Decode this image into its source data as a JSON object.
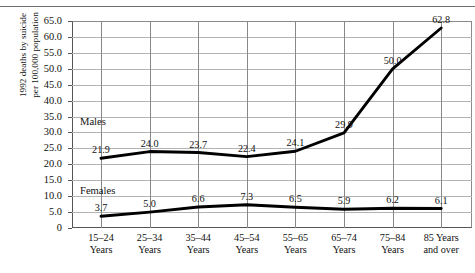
{
  "figure": {
    "has_top_rule": true,
    "background": "#ffffff",
    "line_color": "#000000",
    "gridline_color": "#b3b3b3",
    "vertical_gridline_color": "#888888",
    "axis_color": "#555555"
  },
  "chart_data": {
    "type": "line",
    "title": "",
    "subtitle": "",
    "xlabel": "",
    "ylabel_lines": [
      "1992 deaths by suicide",
      "per 100,000 population"
    ],
    "ylabel": "1992 deaths by suicide per 100,000 population",
    "categories": [
      "15–24 Years",
      "25–34 Years",
      "35–44 Years",
      "45–54 Years",
      "55–65 Years",
      "65–74 Years",
      "75–84 Years",
      "85 Years and over"
    ],
    "category_lines": [
      [
        "15–24",
        "Years"
      ],
      [
        "25–34",
        "Years"
      ],
      [
        "35–44",
        "Years"
      ],
      [
        "45–54",
        "Years"
      ],
      [
        "55–65",
        "Years"
      ],
      [
        "65–74",
        "Years"
      ],
      [
        "75–84",
        "Years"
      ],
      [
        "85 Years",
        "and over"
      ]
    ],
    "ylim": [
      0,
      65
    ],
    "ytick_labels": [
      "0",
      "5.0",
      "10.0",
      "15.0",
      "20.0",
      "25.0",
      "30.0",
      "35.0",
      "40.0",
      "45.0",
      "50.0",
      "55.0",
      "60.0",
      "65.0"
    ],
    "ytick_values": [
      0,
      5,
      10,
      15,
      20,
      25,
      30,
      35,
      40,
      45,
      50,
      55,
      60,
      65
    ],
    "grid": "horizontal-and-vertical",
    "legend_position": "inline-labels",
    "series": [
      {
        "name": "Males",
        "values": [
          21.9,
          24.0,
          23.7,
          22.4,
          24.1,
          29.9,
          50.0,
          62.8
        ],
        "value_labels": [
          "21.9",
          "24.0",
          "23.7",
          "22.4",
          "24.1",
          "29.9",
          "50.0",
          "62.8"
        ]
      },
      {
        "name": "Females",
        "values": [
          3.7,
          5.0,
          6.6,
          7.3,
          6.5,
          5.9,
          6.2,
          6.1
        ],
        "value_labels": [
          "3.7",
          "5.0",
          "6.6",
          "7.3",
          "6.5",
          "5.9",
          "6.2",
          "6.1"
        ]
      }
    ]
  }
}
